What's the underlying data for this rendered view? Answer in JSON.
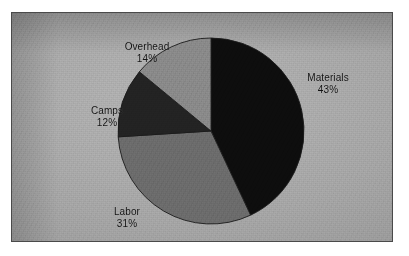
{
  "chart_data": {
    "type": "pie",
    "title": "",
    "subtitle": "",
    "xlabel": "",
    "ylabel": "",
    "legend_position": "none",
    "grid": false,
    "labels_show_percent": true,
    "start_angle_deg": 0,
    "direction": "clockwise",
    "categories": [
      "Materials",
      "Labor",
      "Camps",
      "Overhead"
    ],
    "values": [
      43,
      31,
      12,
      14
    ],
    "unit": "%",
    "total": 100,
    "slices": [
      {
        "label": "Materials",
        "value": 43,
        "value_text": "43%",
        "color": "#0d0d0d",
        "start_deg": 0.0,
        "end_deg": 154.8
      },
      {
        "label": "Labor",
        "value": 31,
        "value_text": "31%",
        "color": "#6e6e6e",
        "start_deg": 154.8,
        "end_deg": 266.4
      },
      {
        "label": "Camps",
        "value": 12,
        "value_text": "12%",
        "color": "#232323",
        "start_deg": 266.4,
        "end_deg": 309.6
      },
      {
        "label": "Overhead",
        "value": 14,
        "value_text": "14%",
        "color": "#8d8d8d",
        "start_deg": 309.6,
        "end_deg": 360.0
      }
    ]
  },
  "labels": {
    "overhead": {
      "name": "Overhead",
      "value": "14%"
    },
    "materials": {
      "name": "Materials",
      "value": "43%"
    },
    "camps": {
      "name": "Camps",
      "value": "12%"
    },
    "labor": {
      "name": "Labor",
      "value": "31%"
    }
  },
  "colors": {
    "materials": "#0d0d0d",
    "labor": "#6e6e6e",
    "camps": "#232323",
    "overhead": "#8d8d8d",
    "frame_border": "#4a4a4a",
    "background": "#ababab",
    "label_text": "#121212",
    "slice_outline": "#1b1b1b"
  }
}
